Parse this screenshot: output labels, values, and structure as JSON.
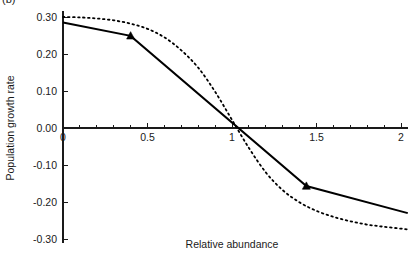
{
  "figure": {
    "panel_tag": "(b)",
    "background": "#ffffff",
    "ink_color": "#000000"
  },
  "chart_data": {
    "type": "line",
    "title": "",
    "subtitle": "",
    "xlabel": "Relative abundance",
    "ylabel": "Population growth rate",
    "xlim": [
      0,
      2.04
    ],
    "ylim": [
      -0.31,
      0.315
    ],
    "grid": false,
    "legend_position": "none",
    "x_ticks_major": [
      0,
      0.5,
      1,
      1.5,
      2
    ],
    "x_tick_labels": [
      "0",
      "0.5",
      "1",
      "1.5",
      "2"
    ],
    "x_tick_minor_step": 0.1,
    "y_ticks_major": [
      0.3,
      0.2,
      0.1,
      0,
      -0.1,
      -0.2,
      -0.3
    ],
    "y_tick_labels": [
      "0.30",
      "0.20",
      "0.10",
      "0.00",
      "-0.10",
      "-0.20",
      "-0.30"
    ],
    "x_axis_position_y": 0,
    "y_axis_position_x": 0,
    "series": [
      {
        "name": "observed-piecewise",
        "style": "solid",
        "marker": "filled-triangle",
        "x": [
          0,
          0.4,
          1.44,
          2.04
        ],
        "y": [
          0.285,
          0.249,
          -0.157,
          -0.23
        ],
        "marker_points": [
          {
            "x": 0.4,
            "y": 0.249
          },
          {
            "x": 1.44,
            "y": -0.157
          }
        ]
      },
      {
        "name": "fitted-curve",
        "style": "dotted",
        "marker": "none",
        "x": [
          0,
          0.1,
          0.2,
          0.3,
          0.4,
          0.5,
          0.6,
          0.7,
          0.8,
          0.9,
          1.0,
          1.1,
          1.2,
          1.3,
          1.4,
          1.5,
          1.6,
          1.7,
          1.8,
          1.9,
          2.0,
          2.04
        ],
        "y": [
          0.3,
          0.299,
          0.296,
          0.291,
          0.282,
          0.268,
          0.245,
          0.21,
          0.163,
          0.098,
          0.022,
          -0.054,
          -0.12,
          -0.168,
          -0.201,
          -0.224,
          -0.24,
          -0.252,
          -0.261,
          -0.267,
          -0.272,
          -0.274
        ]
      }
    ]
  }
}
